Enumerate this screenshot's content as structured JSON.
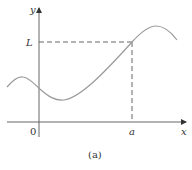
{
  "figure": {
    "caption": "(a)",
    "x_axis_label": "x",
    "y_axis_label": "y",
    "origin_label": "0",
    "point_x_label": "a",
    "point_y_label": "L"
  },
  "colors": {
    "curve": "#9a9a9a",
    "axes": "#666666",
    "dashed": "#666666",
    "text": "#333333"
  }
}
